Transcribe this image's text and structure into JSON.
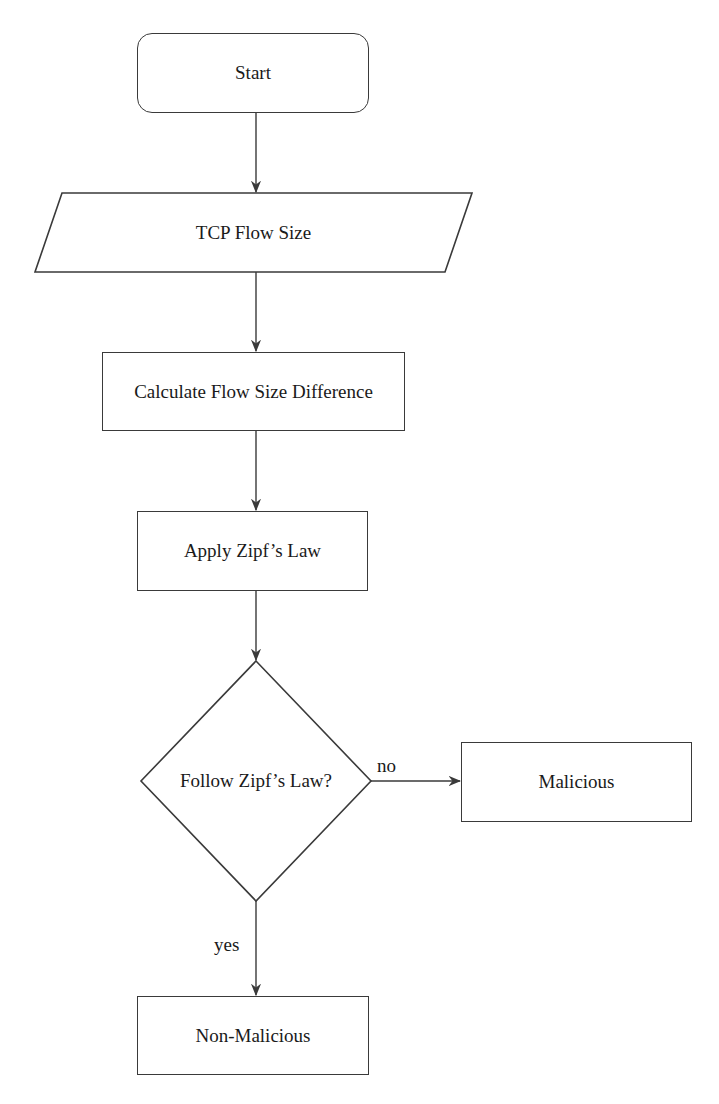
{
  "diagram": {
    "type": "flowchart",
    "nodes": [
      {
        "id": "start",
        "shape": "rounded-rect",
        "label": "Start"
      },
      {
        "id": "input",
        "shape": "parallelogram",
        "label": "TCP Flow Size"
      },
      {
        "id": "calc",
        "shape": "rect",
        "label": "Calculate Flow Size Difference"
      },
      {
        "id": "zipf",
        "shape": "rect",
        "label": "Apply Zipf’s Law"
      },
      {
        "id": "decision",
        "shape": "diamond",
        "label": "Follow Zipf’s Law?"
      },
      {
        "id": "malicious",
        "shape": "rect",
        "label": "Malicious"
      },
      {
        "id": "nonmalicious",
        "shape": "rect",
        "label": "Non-Malicious"
      }
    ],
    "edges": [
      {
        "from": "start",
        "to": "input",
        "label": ""
      },
      {
        "from": "input",
        "to": "calc",
        "label": ""
      },
      {
        "from": "calc",
        "to": "zipf",
        "label": ""
      },
      {
        "from": "zipf",
        "to": "decision",
        "label": ""
      },
      {
        "from": "decision",
        "to": "malicious",
        "label": "no"
      },
      {
        "from": "decision",
        "to": "nonmalicious",
        "label": "yes"
      }
    ]
  },
  "labels": {
    "start": "Start",
    "input": "TCP Flow Size",
    "calc": "Calculate Flow Size Difference",
    "zipf": "Apply Zipf’s Law",
    "decision": "Follow Zipf’s Law?",
    "malicious": "Malicious",
    "nonmalicious": "Non-Malicious",
    "edge_no": "no",
    "edge_yes": "yes"
  },
  "colors": {
    "stroke": "#3a3a3a",
    "text": "#1a1a1a",
    "background": "#ffffff"
  }
}
